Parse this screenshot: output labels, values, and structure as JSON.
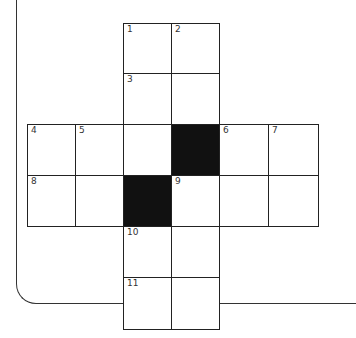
{
  "puzzle": {
    "type": "crossword",
    "grid_origin": {
      "x": 27,
      "y": 23
    },
    "cell_size": 49,
    "cells": [
      {
        "col": 2,
        "row": 0,
        "number": "1",
        "black": false
      },
      {
        "col": 3,
        "row": 0,
        "number": "2",
        "black": false
      },
      {
        "col": 2,
        "row": 1,
        "number": "3",
        "black": false
      },
      {
        "col": 3,
        "row": 1,
        "number": "",
        "black": false
      },
      {
        "col": 0,
        "row": 2,
        "number": "4",
        "black": false
      },
      {
        "col": 1,
        "row": 2,
        "number": "5",
        "black": false
      },
      {
        "col": 2,
        "row": 2,
        "number": "",
        "black": false
      },
      {
        "col": 3,
        "row": 2,
        "number": "",
        "black": true
      },
      {
        "col": 4,
        "row": 2,
        "number": "6",
        "black": false
      },
      {
        "col": 5,
        "row": 2,
        "number": "7",
        "black": false
      },
      {
        "col": 0,
        "row": 3,
        "number": "8",
        "black": false
      },
      {
        "col": 1,
        "row": 3,
        "number": "",
        "black": false
      },
      {
        "col": 2,
        "row": 3,
        "number": "",
        "black": true
      },
      {
        "col": 3,
        "row": 3,
        "number": "9",
        "black": false
      },
      {
        "col": 4,
        "row": 3,
        "number": "",
        "black": false
      },
      {
        "col": 5,
        "row": 3,
        "number": "",
        "black": false
      },
      {
        "col": 2,
        "row": 4,
        "number": "10",
        "black": false
      },
      {
        "col": 3,
        "row": 4,
        "number": "",
        "black": false
      },
      {
        "col": 2,
        "row": 5,
        "number": "11",
        "black": false
      },
      {
        "col": 3,
        "row": 5,
        "number": "",
        "black": false
      }
    ]
  }
}
